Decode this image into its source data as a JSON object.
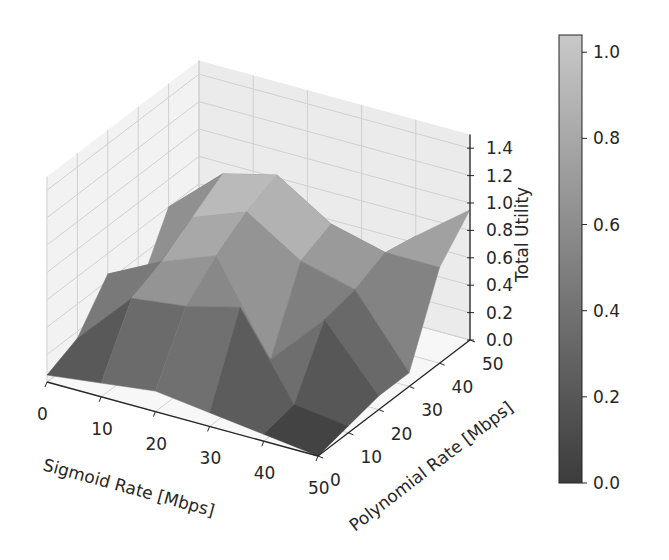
{
  "chart_data": {
    "type": "surface3d",
    "title": "",
    "xlabel": "Sigmoid Rate [Mbps]",
    "ylabel": "Polynomial Rate [Mbps]",
    "zlabel": "Total Utility",
    "x_ticks": [
      "0",
      "10",
      "20",
      "30",
      "40",
      "50"
    ],
    "y_ticks": [
      "0",
      "10",
      "20",
      "30",
      "40",
      "50"
    ],
    "z_ticks": [
      "0.0",
      "0.2",
      "0.4",
      "0.6",
      "0.8",
      "1.0",
      "1.2",
      "1.4"
    ],
    "xlim": [
      0,
      50
    ],
    "ylim": [
      0,
      50
    ],
    "zlim": [
      0,
      1.5
    ],
    "colormap": "gray",
    "colorbar": {
      "label": "",
      "ticks": [
        "0.0",
        "0.2",
        "0.4",
        "0.6",
        "0.8",
        "1.0"
      ],
      "range": [
        0,
        1.04
      ]
    },
    "grid": true,
    "x": [
      0,
      10,
      20,
      30,
      40,
      50
    ],
    "y": [
      0,
      10,
      20,
      30,
      40,
      50
    ],
    "z": [
      [
        0.05,
        0.15,
        0.45,
        0.15,
        0.6,
        0.1
      ],
      [
        0.1,
        0.55,
        0.65,
        0.8,
        0.95,
        0.2
      ],
      [
        0.15,
        0.6,
        0.8,
        0.95,
        1.05,
        0.25
      ],
      [
        0.1,
        0.7,
        0.15,
        0.7,
        0.8,
        0.2
      ],
      [
        0.05,
        0.1,
        0.55,
        0.6,
        0.7,
        0.65
      ],
      [
        0.0,
        0.05,
        0.1,
        0.1,
        0.7,
        0.95
      ]
    ],
    "z_orientation": "z[i][j] where i indexes Sigmoid Rate (x), j indexes Polynomial Rate (y)"
  },
  "labels": {
    "xlabel": "Sigmoid Rate [Mbps]",
    "ylabel": "Polynomial Rate [Mbps]",
    "zlabel": "Total Utility"
  }
}
